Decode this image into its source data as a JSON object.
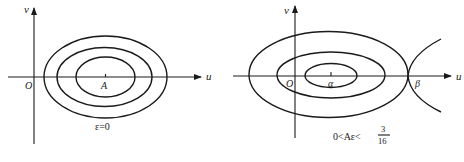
{
  "panels": [
    {
      "id": "left",
      "axes": {
        "x_label": "u",
        "y_label": "v",
        "origin_label": "O"
      },
      "center_label": "A",
      "caption": "ε=0",
      "curves": [
        {
          "type": "ellipse",
          "role": "outer-orbit"
        },
        {
          "type": "ellipse",
          "role": "middle-orbit"
        },
        {
          "type": "ellipse",
          "role": "inner-orbit"
        }
      ]
    },
    {
      "id": "right",
      "axes": {
        "x_label": "u",
        "y_label": "v",
        "origin_label": "O"
      },
      "center_label": "α",
      "saddle_label": "β",
      "caption": {
        "prefix": "0<Aε<",
        "fraction_numerator": "3",
        "fraction_denominator": "16"
      },
      "curves": [
        {
          "type": "ellipse",
          "role": "separatrix-orbit"
        },
        {
          "type": "ellipse",
          "role": "middle-orbit"
        },
        {
          "type": "ellipse",
          "role": "inner-orbit"
        },
        {
          "type": "hyperbola-branch",
          "role": "saddle-branches"
        }
      ]
    }
  ],
  "colors": {
    "ink": "#1a1a1a",
    "background": "#ffffff"
  }
}
